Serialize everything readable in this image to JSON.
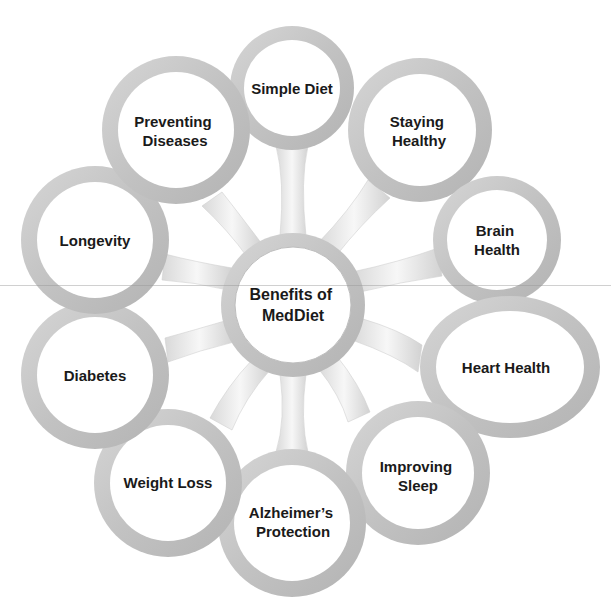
{
  "diagram": {
    "title": "Benefits of MedDiet",
    "center": {
      "lines": [
        "Benefits of",
        "MedDiet"
      ]
    },
    "nodes": [
      {
        "id": "simple-diet",
        "lines": [
          "Simple Diet"
        ]
      },
      {
        "id": "staying-healthy",
        "lines": [
          "Staying",
          "Healthy"
        ]
      },
      {
        "id": "brain-health",
        "lines": [
          "Brain",
          "Health"
        ]
      },
      {
        "id": "heart-health",
        "lines": [
          "Heart Health"
        ]
      },
      {
        "id": "improving-sleep",
        "lines": [
          "Improving",
          "Sleep"
        ]
      },
      {
        "id": "alzheimers-protection",
        "lines": [
          "Alzheimer’s",
          "Protection"
        ]
      },
      {
        "id": "weight-loss",
        "lines": [
          "Weight Loss"
        ]
      },
      {
        "id": "diabetes",
        "lines": [
          "Diabetes"
        ]
      },
      {
        "id": "longevity",
        "lines": [
          "Longevity"
        ]
      },
      {
        "id": "preventing-diseases",
        "lines": [
          "Preventing",
          "Diseases"
        ]
      }
    ],
    "colors": {
      "ring": "#c4c4c4",
      "ring_highlight": "#e6e6e6",
      "ring_dark": "#a9a9a9",
      "fill": "#ffffff",
      "text": "#1a1a1a",
      "background": "#ffffff"
    }
  }
}
